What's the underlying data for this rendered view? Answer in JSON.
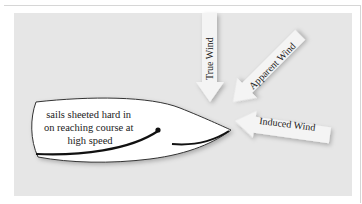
{
  "diagram": {
    "boat_caption": [
      "sails sheeted hard in",
      "on reaching course at",
      "high speed"
    ],
    "arrows": {
      "true_wind": "True Wind",
      "apparent_wind": "Apparent Wind",
      "induced_wind": "Induced Wind"
    },
    "colors": {
      "panel": "#e6e6e6",
      "hull": "#ffffff",
      "arrow": "#f4f4f4",
      "sail": "#111111"
    }
  }
}
